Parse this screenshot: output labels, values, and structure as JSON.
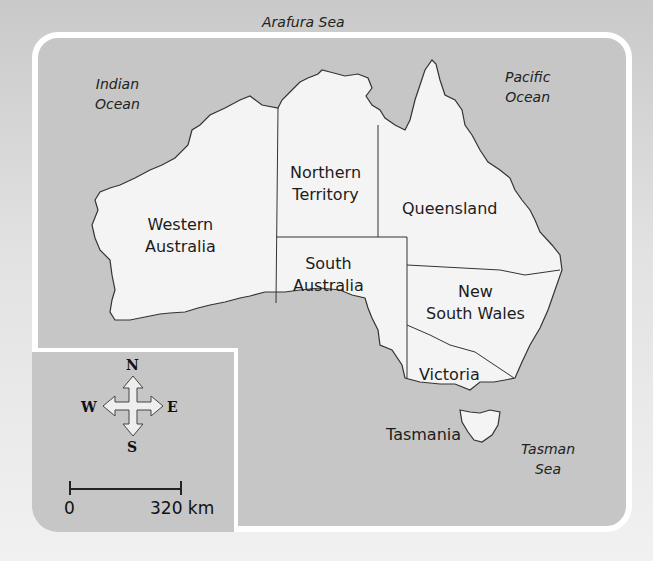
{
  "map": {
    "title": "Australia states and territories",
    "colors": {
      "sea": "#c6c6c6",
      "land": "#f4f4f4",
      "border": "#ffffff",
      "outline": "#333333"
    },
    "seas": [
      {
        "id": "arafura",
        "label": "Arafura Sea"
      },
      {
        "id": "indian",
        "label": "Indian\nOcean"
      },
      {
        "id": "pacific",
        "label": "Pacific\nOcean"
      },
      {
        "id": "tasman",
        "label": "Tasman\nSea"
      }
    ],
    "regions": [
      {
        "id": "wa",
        "label": "Western\nAustralia"
      },
      {
        "id": "nt",
        "label": "Northern\nTerritory"
      },
      {
        "id": "qld",
        "label": "Queensland"
      },
      {
        "id": "sa",
        "label": "South\nAustralia"
      },
      {
        "id": "nsw",
        "label": "New\nSouth Wales"
      },
      {
        "id": "vic",
        "label": "Victoria"
      },
      {
        "id": "tas",
        "label": "Tasmania"
      }
    ]
  },
  "compass": {
    "n": "N",
    "s": "S",
    "e": "E",
    "w": "W"
  },
  "scale": {
    "start": "0",
    "end": "320 km"
  }
}
